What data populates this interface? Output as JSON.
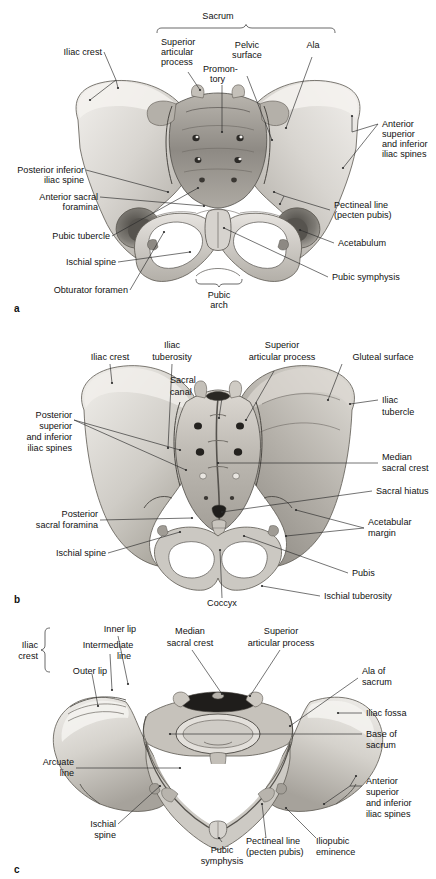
{
  "figure": {
    "panels": [
      {
        "letter": "a",
        "view": "anterior-view",
        "labels": {
          "sacrum": "Sacrum",
          "iliac_crest": "Iliac crest",
          "superior_articular_process_1": "Superior",
          "superior_articular_process_2": "articular",
          "superior_articular_process_3": "process",
          "promontory_1": "Promon-",
          "promontory_2": "tory",
          "pelvic_surface_1": "Pelvic",
          "pelvic_surface_2": "surface",
          "ala": "Ala",
          "anterior_spines_1": "Anterior",
          "anterior_spines_2": "superior",
          "anterior_spines_3": "and inferior",
          "anterior_spines_4": "iliac spines",
          "posterior_inferior_1": "Posterior inferior",
          "posterior_inferior_2": "iliac spine",
          "anterior_sacral_foramina_1": "Anterior sacral",
          "anterior_sacral_foramina_2": "foramina",
          "pubic_tubercle": "Pubic tubercle",
          "ischial_spine": "Ischial spine",
          "obturator_foramen": "Obturator foramen",
          "pectineal_line_1": "Pectineal line",
          "pectineal_line_2": "(pecten pubis)",
          "acetabulum": "Acetabulum",
          "pubic_symphysis": "Pubic symphysis",
          "pubic_arch_1": "Pubic",
          "pubic_arch_2": "arch"
        }
      },
      {
        "letter": "b",
        "view": "posterior-view",
        "labels": {
          "iliac_crest": "Iliac crest",
          "iliac_tuberosity_1": "Iliac",
          "iliac_tuberosity_2": "tuberosity",
          "sacral_canal_1": "Sacral",
          "sacral_canal_2": "canal",
          "superior_articular_process_1": "Superior",
          "superior_articular_process_2": "articular process",
          "gluteal_surface": "Gluteal surface",
          "iliac_tubercle_1": "Iliac",
          "iliac_tubercle_2": "tubercle",
          "posterior_spines_1": "Posterior",
          "posterior_spines_2": "superior",
          "posterior_spines_3": "and inferior",
          "posterior_spines_4": "iliac spines",
          "median_sacral_crest_1": "Median",
          "median_sacral_crest_2": "sacral crest",
          "sacral_hiatus": "Sacral hiatus",
          "acetabular_margin_1": "Acetabular",
          "acetabular_margin_2": "margin",
          "posterior_sacral_foramina_1": "Posterior",
          "posterior_sacral_foramina_2": "sacral foramina",
          "ischial_spine": "Ischial spine",
          "pubis": "Pubis",
          "ischial_tuberosity": "Ischial tuberosity",
          "coccyx": "Coccyx"
        }
      },
      {
        "letter": "c",
        "view": "superior-view",
        "labels": {
          "iliac_crest_1": "Iliac",
          "iliac_crest_2": "crest",
          "inner_lip": "Inner lip",
          "intermediate_line_1": "Intermediate",
          "intermediate_line_2": "line",
          "outer_lip": "Outer lip",
          "median_sacral_crest_1": "Median",
          "median_sacral_crest_2": "sacral crest",
          "superior_articular_process_1": "Superior",
          "superior_articular_process_2": "articular process",
          "ala_of_sacrum_1": "Ala of",
          "ala_of_sacrum_2": "sacrum",
          "iliac_fossa": "Iliac fossa",
          "base_of_sacrum_1": "Base of",
          "base_of_sacrum_2": "sacrum",
          "arcuate_line_1": "Arcuate",
          "arcuate_line_2": "line",
          "anterior_spines_1": "Anterior",
          "anterior_spines_2": "superior",
          "anterior_spines_3": "and inferior",
          "anterior_spines_4": "iliac spines",
          "ischial_spine_1": "Ischial",
          "ischial_spine_2": "spine",
          "pubic_symphysis_1": "Pubic",
          "pubic_symphysis_2": "symphysis",
          "pectineal_line_1": "Pectineal line",
          "pectineal_line_2": "(pecten pubis)",
          "iliopubic_eminence_1": "Iliopubic",
          "iliopubic_eminence_2": "eminence"
        }
      }
    ]
  },
  "colors": {
    "background": "#ffffff",
    "text": "#111111",
    "leader_line": "#2a2a2a",
    "bone_light": "#e8e6e2",
    "bone_mid": "#c9c6c0",
    "bone_dark": "#9a968f",
    "bone_shadow": "#6e6a64",
    "cavity": "#ffffff"
  }
}
